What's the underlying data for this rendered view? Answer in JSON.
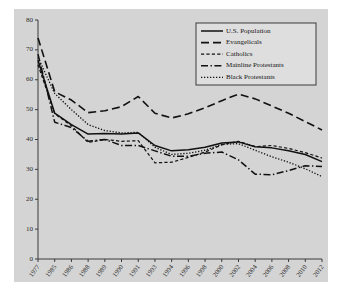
{
  "chart_data": {
    "type": "line",
    "title": "",
    "xlabel": "",
    "ylabel": "",
    "ylim": [
      0,
      80
    ],
    "yticks": [
      0,
      10,
      20,
      30,
      40,
      50,
      60,
      70,
      80
    ],
    "grid": false,
    "legend_position": "top-right",
    "categories": [
      "1977",
      "1985",
      "1986",
      "1988",
      "1989",
      "1990",
      "1991",
      "1993",
      "1994",
      "1996",
      "1998",
      "2000",
      "2002",
      "2004",
      "2006",
      "2008",
      "2010",
      "2012"
    ],
    "series": [
      {
        "name": "U.S. Population",
        "style": "solid",
        "color": "#111111",
        "values": [
          66.5,
          48.8,
          45.0,
          41.8,
          42.0,
          41.8,
          42.2,
          38.0,
          36.2,
          36.6,
          37.4,
          38.8,
          39.2,
          37.6,
          37.2,
          36.2,
          35.0,
          32.6
        ]
      },
      {
        "name": "Evangelicals",
        "style": "long-dash",
        "color": "#111111",
        "values": [
          74.0,
          56.0,
          53.2,
          49.0,
          49.6,
          51.0,
          54.4,
          48.8,
          47.2,
          48.6,
          50.6,
          53.0,
          55.2,
          53.6,
          51.2,
          48.8,
          46.0,
          43.2
        ]
      },
      {
        "name": "Catholics",
        "style": "short-dash",
        "color": "#111111",
        "values": [
          65.0,
          48.6,
          44.6,
          39.0,
          40.0,
          39.4,
          39.6,
          32.2,
          32.4,
          34.0,
          35.8,
          38.2,
          39.4,
          37.6,
          38.0,
          37.0,
          35.6,
          33.8
        ]
      },
      {
        "name": "Mainline Protestants",
        "style": "dash-dot",
        "color": "#111111",
        "values": [
          68.6,
          45.8,
          44.0,
          39.4,
          40.0,
          38.0,
          38.0,
          36.2,
          34.4,
          34.4,
          35.4,
          35.8,
          33.2,
          28.4,
          28.2,
          29.6,
          31.2,
          31.0
        ]
      },
      {
        "name": "Black Protestants",
        "style": "dotted",
        "color": "#111111",
        "values": [
          67.5,
          55.4,
          50.0,
          45.0,
          43.0,
          42.2,
          42.4,
          37.4,
          35.0,
          35.4,
          36.4,
          38.4,
          38.6,
          36.4,
          34.2,
          32.4,
          30.2,
          27.6
        ]
      }
    ]
  },
  "legend": {
    "items": [
      {
        "label": "U.S. Population",
        "style": "solid"
      },
      {
        "label": "Evangelicals",
        "style": "long-dash"
      },
      {
        "label": "Catholics",
        "style": "short-dash"
      },
      {
        "label": "Mainline Protestants",
        "style": "dash-dot"
      },
      {
        "label": "Black Protestants",
        "style": "dotted"
      }
    ]
  }
}
